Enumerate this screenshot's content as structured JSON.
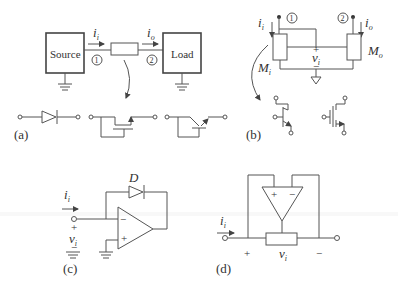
{
  "panels": {
    "a": {
      "label": "(a)",
      "source_label": "Source",
      "load_label": "Load",
      "current_in": "i",
      "current_in_sub": "i",
      "current_out": "i",
      "current_out_sub": "o",
      "port1": "1",
      "port2": "2",
      "devices": [
        "diode",
        "mosfet",
        "bjt"
      ]
    },
    "b": {
      "label": "(b)",
      "current_in": "i",
      "current_in_sub": "i",
      "current_out": "i",
      "current_out_sub": "o",
      "port1": "1",
      "port2": "2",
      "voltage": "v",
      "voltage_sub": "i",
      "plus": "+",
      "minus": "−",
      "mi": "M",
      "mi_sub": "i",
      "mo": "M",
      "mo_sub": "o",
      "devices": [
        "bjt",
        "mosfet"
      ]
    },
    "c": {
      "label": "(c)",
      "current": "i",
      "current_sub": "i",
      "voltage": "v",
      "voltage_sub": "i",
      "plus": "+",
      "minus": "−",
      "diode": "D",
      "opamp_minus": "−",
      "opamp_plus": "+"
    },
    "d": {
      "label": "(d)",
      "current": "i",
      "current_sub": "i",
      "voltage": "v",
      "voltage_sub": "i",
      "plus": "+",
      "minus": "−",
      "opamp_plus": "+",
      "opamp_minus": "−"
    }
  }
}
